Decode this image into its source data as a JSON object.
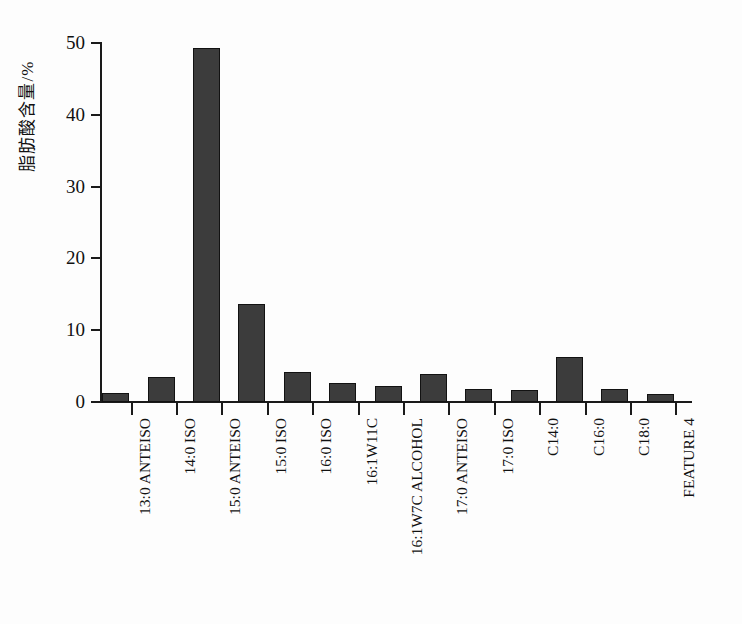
{
  "chart_data": {
    "type": "bar",
    "title": "",
    "xlabel": "",
    "ylabel": "脂肪酸含量/%",
    "ylim": [
      0,
      50
    ],
    "yticks": [
      0,
      10,
      20,
      30,
      40,
      50
    ],
    "grid": false,
    "legend": "none",
    "bar_color": "#3c3c3c",
    "categories": [
      "13:0 ANTEISO",
      "14:0 ISO",
      "15:0 ANTEISO",
      "15:0 ISO",
      "16:0 ISO",
      "16:1W11C",
      "16:1W7C ALCOHOL",
      "17:0 ANTEISO",
      "17:0 ISO",
      "C14:0",
      "C16:0",
      "C18:0",
      "FEATURE 4"
    ],
    "values": [
      1.2,
      3.5,
      49.3,
      13.7,
      4.2,
      2.6,
      2.2,
      3.9,
      1.8,
      1.7,
      6.2,
      1.8,
      1.1
    ]
  }
}
